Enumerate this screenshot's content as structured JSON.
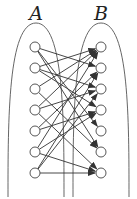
{
  "diagram": {
    "type": "bipartite-graph",
    "sets": [
      {
        "label": "A",
        "cx": 36,
        "nodes_x": 35
      },
      {
        "label": "B",
        "cx": 101,
        "nodes_x": 101
      }
    ],
    "node_ys": [
      47,
      68,
      89,
      110,
      131,
      152,
      173
    ],
    "edges": [
      [
        1,
        2
      ],
      [
        1,
        5
      ],
      [
        1,
        6
      ],
      [
        2,
        1
      ],
      [
        2,
        3
      ],
      [
        2,
        4
      ],
      [
        3,
        1
      ],
      [
        3,
        6
      ],
      [
        4,
        1
      ],
      [
        4,
        3
      ],
      [
        4,
        7
      ],
      [
        5,
        2
      ],
      [
        5,
        4
      ],
      [
        6,
        1
      ],
      [
        6,
        4
      ],
      [
        6,
        7
      ],
      [
        7,
        2
      ],
      [
        7,
        3
      ],
      [
        7,
        7
      ]
    ],
    "colors": {
      "stroke": "#333333",
      "node_fill": "#ffffff",
      "ellipse": "#555555"
    }
  }
}
